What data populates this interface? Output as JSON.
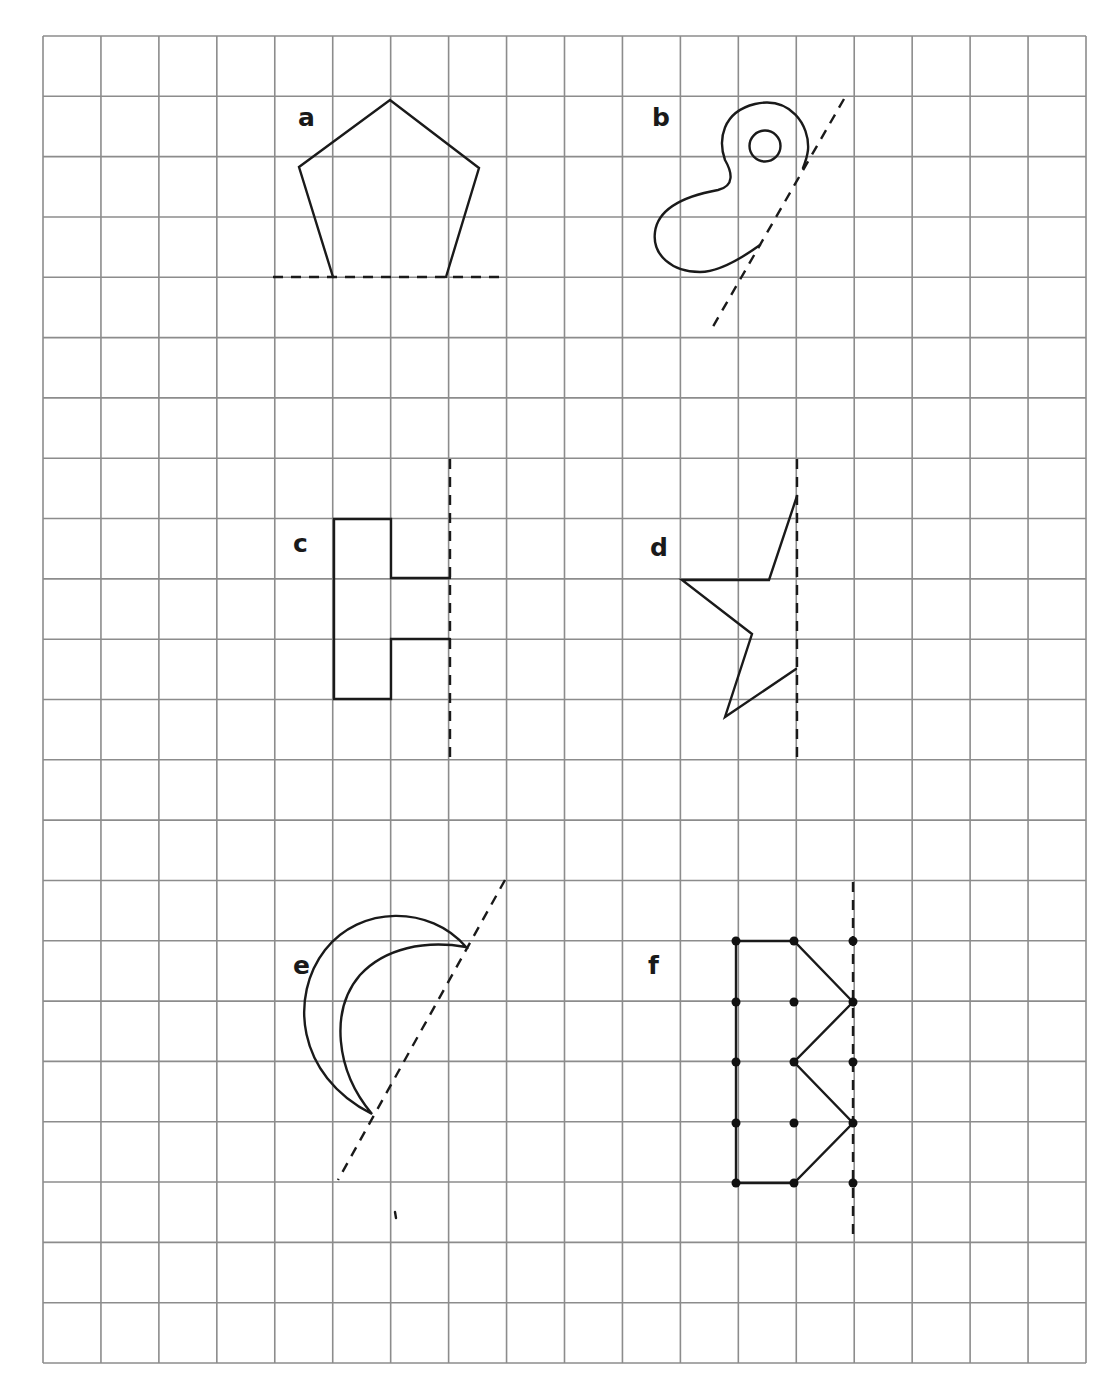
{
  "worksheet": {
    "header_fragment": "",
    "grid": {
      "columns": 18,
      "rows": 22,
      "left": 43,
      "top": 36,
      "right": 1086,
      "bottom": 1363,
      "line_color": "#8c8c8c"
    },
    "colors": {
      "ink": "#1a1a1a",
      "grid": "#8c8c8c",
      "paper": "#ffffff"
    },
    "problems": [
      {
        "id": "a",
        "label": "a",
        "shape": "pentagon",
        "mirror_line": "horizontal dashed line along base"
      },
      {
        "id": "b",
        "label": "b",
        "shape": "curved blob with inner circle",
        "mirror_line": "diagonal dashed line"
      },
      {
        "id": "c",
        "label": "c",
        "shape": "rectilinear E-like shape",
        "mirror_line": "vertical dashed line"
      },
      {
        "id": "d",
        "label": "d",
        "shape": "half star",
        "mirror_line": "vertical dashed line"
      },
      {
        "id": "e",
        "label": "e",
        "shape": "crescent moon",
        "mirror_line": "diagonal dashed line"
      },
      {
        "id": "f",
        "label": "f",
        "shape": "zigzag dotted polygon",
        "mirror_line": "vertical dashed line"
      }
    ]
  }
}
